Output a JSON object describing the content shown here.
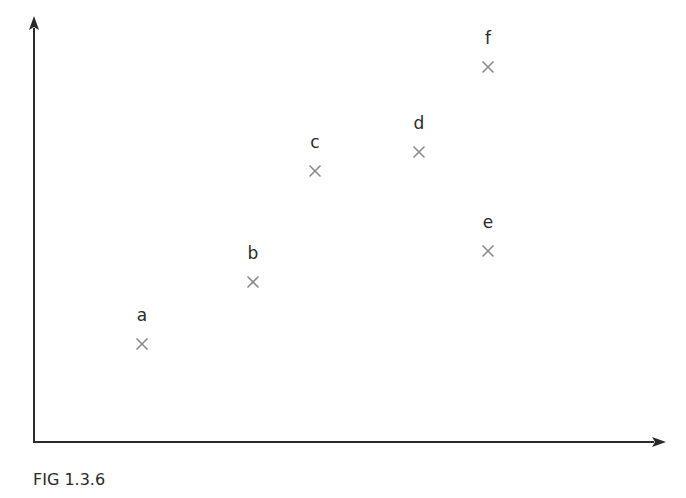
{
  "caption": "FIG 1.3.6",
  "colors": {
    "axis": "#2a2a2a",
    "marker": "#8a8a8a",
    "label": "#2a2a2a"
  },
  "chart_data": {
    "type": "scatter",
    "title": "",
    "xlabel": "",
    "ylabel": "",
    "grid": false,
    "legend": null,
    "axes": "arrows only, no ticks",
    "points": [
      {
        "label": "a",
        "px": 142,
        "py": 343
      },
      {
        "label": "b",
        "px": 253,
        "py": 281
      },
      {
        "label": "c",
        "px": 315,
        "py": 170
      },
      {
        "label": "d",
        "px": 419,
        "py": 151
      },
      {
        "label": "e",
        "px": 488,
        "py": 250
      },
      {
        "label": "f",
        "px": 488,
        "py": 66
      }
    ],
    "annotations": [
      "FIG 1.3.6"
    ]
  }
}
